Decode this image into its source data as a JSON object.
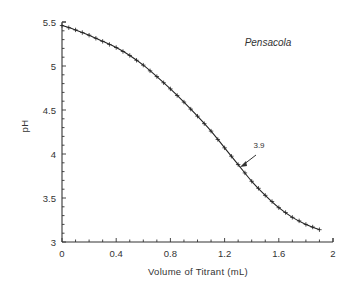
{
  "chart_data": {
    "type": "line",
    "title": "Pensacola",
    "xlabel": "Volume of Titrant (mL)",
    "ylabel": "pH",
    "xlim": [
      0,
      2
    ],
    "ylim": [
      3,
      5.5
    ],
    "x_ticks": [
      "0",
      "0.4",
      "0.8",
      "1.2",
      "1.6",
      "2"
    ],
    "y_ticks": [
      "3",
      "3.5",
      "4",
      "4.5",
      "5",
      "5.5"
    ],
    "grid": false,
    "legend": null,
    "marker": "plus",
    "series": [
      {
        "name": "Pensacola",
        "x": [
          0.0,
          0.1,
          0.2,
          0.3,
          0.4,
          0.5,
          0.6,
          0.7,
          0.8,
          0.9,
          1.0,
          1.1,
          1.2,
          1.3,
          1.4,
          1.5,
          1.6,
          1.7,
          1.8,
          1.9
        ],
        "y": [
          5.46,
          5.41,
          5.35,
          5.28,
          5.21,
          5.12,
          5.01,
          4.88,
          4.74,
          4.59,
          4.43,
          4.26,
          4.07,
          3.88,
          3.69,
          3.53,
          3.39,
          3.28,
          3.2,
          3.14
        ]
      }
    ],
    "annotations": [
      {
        "text": "3.9",
        "arrow_to": {
          "x": 1.31,
          "y": 3.87
        },
        "description": "inflection point label"
      }
    ]
  },
  "labels": {
    "title": "Pensacola",
    "xlabel": "Volume of Titrant (mL)",
    "ylabel": "pH",
    "annotation": "3.9"
  },
  "colors": {
    "line": "#222222",
    "axis": "#333333",
    "background": "#ffffff"
  }
}
